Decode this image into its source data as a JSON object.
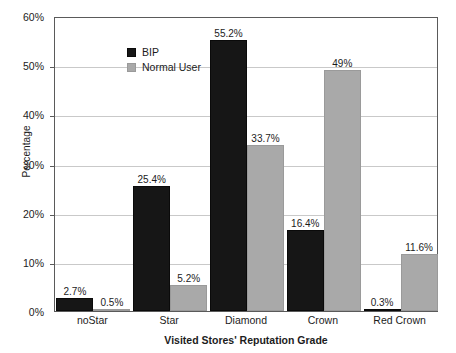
{
  "chart_data": {
    "type": "bar",
    "title": "",
    "xlabel": "Visited Stores' Reputation Grade",
    "ylabel": "Percentage",
    "categories": [
      "noStar",
      "Star",
      "Diamond",
      "Crown",
      "Red Crown"
    ],
    "series": [
      {
        "name": "BIP",
        "color": "#161616",
        "values": [
          2.7,
          25.4,
          55.2,
          16.4,
          0.3
        ],
        "labels": [
          "2.7%",
          "25.4%",
          "55.2%",
          "16.4%",
          "0.3%"
        ]
      },
      {
        "name": "Normal User",
        "color": "#a9a9a9",
        "values": [
          0.5,
          5.2,
          33.7,
          49,
          11.6
        ],
        "labels": [
          "0.5%",
          "5.2%",
          "33.7%",
          "49%",
          "11.6%"
        ]
      }
    ],
    "ylim": [
      0,
      60
    ],
    "yticks": [
      0,
      10,
      20,
      30,
      40,
      50,
      60
    ],
    "ytick_labels": [
      "0%",
      "10%",
      "20%",
      "30%",
      "40%",
      "50%",
      "60%"
    ],
    "grid": true,
    "legend_position": "top-left",
    "legend": [
      "BIP",
      "Normal User"
    ]
  }
}
